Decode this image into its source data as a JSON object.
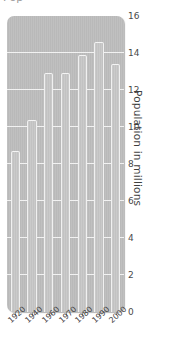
{
  "figure": {
    "clipped_title": "Pop",
    "background_color": "#ffffff",
    "plot_background_color": "#b9b9b9",
    "bar_color": "#c2c2c2",
    "gridline_color": "#f2f2f2"
  },
  "y_axis": {
    "title": "Population in millions",
    "ticks": [
      "0",
      "2",
      "4",
      "6",
      "8",
      "10",
      "12",
      "14",
      "16"
    ]
  },
  "x_axis": {
    "title": "",
    "ticks": [
      "1920",
      "1940",
      "1960",
      "1970",
      "1980",
      "1990",
      "2000"
    ]
  },
  "chart_data": {
    "type": "bar",
    "title": "",
    "subtitle": "",
    "xlabel": "",
    "ylabel": "Population in millions",
    "categories": [
      "1920",
      "1940",
      "1960",
      "1970",
      "1980",
      "1990",
      "2000"
    ],
    "values": [
      8.7,
      10.4,
      12.9,
      12.9,
      13.9,
      14.6,
      13.4
    ],
    "ylim": [
      0,
      16
    ],
    "ytick_step": 2,
    "grid": true,
    "grid_axis": "y",
    "legend": false,
    "legend_position": "none",
    "bar_color": "#c2c2c2",
    "bar_edge_color": "#f0f0f0"
  }
}
